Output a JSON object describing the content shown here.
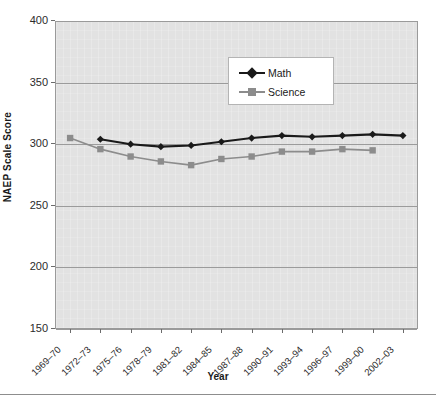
{
  "chart_data": {
    "type": "line",
    "title": "",
    "xlabel": "Year",
    "ylabel": "NAEP Scale Score",
    "ylim": [
      150,
      400
    ],
    "yticks": [
      150,
      200,
      250,
      300,
      350,
      400
    ],
    "grid": true,
    "legend_position": "upper-center",
    "categories": [
      "1969–70",
      "1972–73",
      "1975–76",
      "1978–79",
      "1981–82",
      "1984–85",
      "1987–88",
      "1990–91",
      "1993–94",
      "1996–97",
      "1999–00",
      "2002–03"
    ],
    "series": [
      {
        "name": "Math",
        "color": "#1a1a1a",
        "marker": "diamond",
        "values": [
          null,
          304,
          300,
          298,
          299,
          302,
          305,
          307,
          306,
          307,
          308,
          307
        ]
      },
      {
        "name": "Science",
        "color": "#8c8c8c",
        "marker": "square",
        "values": [
          305,
          296,
          290,
          286,
          283,
          288,
          290,
          294,
          294,
          296,
          295,
          null
        ]
      }
    ]
  },
  "axes": {
    "y_tick_labels": [
      "400",
      "350",
      "300",
      "250",
      "200",
      "150"
    ],
    "y_axis_title": "NAEP Scale Score",
    "x_axis_title": "Year",
    "x_tick_labels": [
      "1969–70",
      "1972–73",
      "1975–76",
      "1978–79",
      "1981–82",
      "1984–85",
      "1987–88",
      "1990–91",
      "1993–94",
      "1996–97",
      "1999–00",
      "2002–03"
    ]
  },
  "legend": {
    "items": [
      {
        "label": "Math",
        "color": "#1a1a1a",
        "marker": "diamond"
      },
      {
        "label": "Science",
        "color": "#8c8c8c",
        "marker": "square"
      }
    ]
  },
  "colors": {
    "plot_background": "#e2e2e2",
    "grid": "#9b9b9b",
    "frame": "#9a9a9a",
    "math": "#1a1a1a",
    "science": "#8c8c8c",
    "text": "#1a1a1a"
  }
}
